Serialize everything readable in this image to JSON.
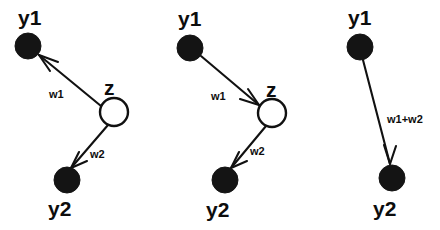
{
  "figure": {
    "title": "",
    "background_color": "#ffffff",
    "ink_color": "#111111",
    "width": 440,
    "height": 230
  },
  "panels": [
    {
      "id": "panel-left",
      "nodes": [
        {
          "id": "y1",
          "label": "y1",
          "type": "filled",
          "cx": 28,
          "cy": 46,
          "r": 13,
          "label_x": 18,
          "label_y": 25
        },
        {
          "id": "z",
          "label": "z",
          "type": "open",
          "cx": 114,
          "cy": 112,
          "r": 14,
          "label_x": 104,
          "label_y": 95
        },
        {
          "id": "y2",
          "label": "y2",
          "type": "filled",
          "cx": 67,
          "cy": 180,
          "r": 13,
          "label_x": 48,
          "label_y": 216
        }
      ],
      "edges": [
        {
          "id": "z-to-y1",
          "label": "w1",
          "from": "z",
          "to": "y1",
          "direction": "z-to-y1",
          "label_x": 49,
          "label_y": 98
        },
        {
          "id": "z-to-y2",
          "label": "w2",
          "from": "z",
          "to": "y2",
          "direction": "z-to-y2",
          "label_x": 90,
          "label_y": 158
        }
      ]
    },
    {
      "id": "panel-middle",
      "nodes": [
        {
          "id": "y1",
          "label": "y1",
          "type": "filled",
          "cx": 190,
          "cy": 48,
          "r": 13,
          "label_x": 178,
          "label_y": 26
        },
        {
          "id": "z",
          "label": "z",
          "type": "open",
          "cx": 272,
          "cy": 113,
          "r": 14,
          "label_x": 266,
          "label_y": 97
        },
        {
          "id": "y2",
          "label": "y2",
          "type": "filled",
          "cx": 225,
          "cy": 180,
          "r": 13,
          "label_x": 206,
          "label_y": 217
        }
      ],
      "edges": [
        {
          "id": "y1-to-z",
          "label": "w1",
          "from": "y1",
          "to": "z",
          "direction": "y1-to-z",
          "label_x": 211,
          "label_y": 100
        },
        {
          "id": "z-to-y2",
          "label": "w2",
          "from": "z",
          "to": "y2",
          "direction": "z-to-y2",
          "label_x": 250,
          "label_y": 155
        }
      ]
    },
    {
      "id": "panel-right",
      "nodes": [
        {
          "id": "y1",
          "label": "y1",
          "type": "filled",
          "cx": 360,
          "cy": 47,
          "r": 13,
          "label_x": 348,
          "label_y": 25
        },
        {
          "id": "y2",
          "label": "y2",
          "type": "filled",
          "cx": 392,
          "cy": 178,
          "r": 13,
          "label_x": 373,
          "label_y": 216
        }
      ],
      "edges": [
        {
          "id": "y1-to-y2",
          "label": "w1+w2",
          "from": "y1",
          "to": "y2",
          "direction": "y1-to-y2",
          "label_x": 387,
          "label_y": 123
        }
      ]
    }
  ]
}
